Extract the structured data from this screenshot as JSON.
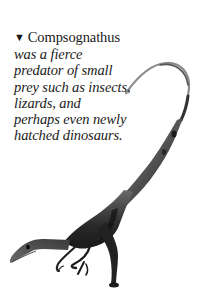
{
  "caption": {
    "marker": "▼",
    "subject": "Compsognathus",
    "lines": [
      "was a fierce",
      "predator of small",
      "prey such as insects,",
      "lizards, and",
      "perhaps even newly",
      "hatched dinosaurs."
    ]
  },
  "illustration": {
    "subject": "Compsognathus",
    "style": "grayscale pencil/airbrush drawing",
    "colors": {
      "ink_dark": "#1c1c1c",
      "ink_mid": "#555555",
      "ink_light": "#9a9a9a",
      "paper": "#ffffff"
    }
  }
}
